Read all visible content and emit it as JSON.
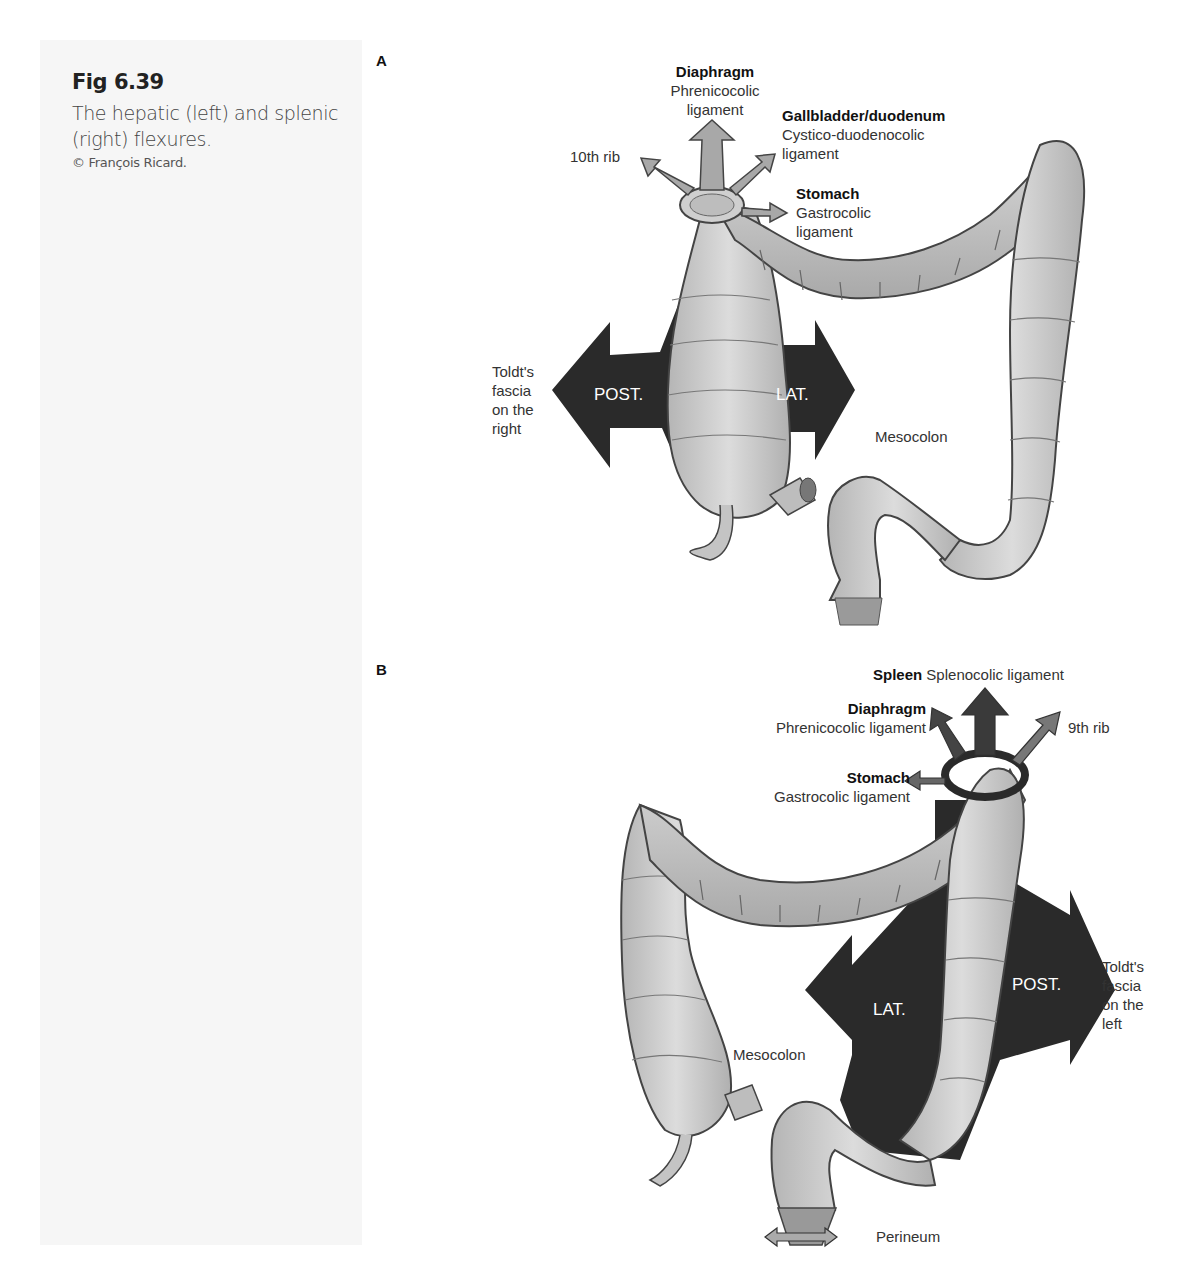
{
  "figure": {
    "number": "Fig 6.39",
    "caption": "The hepatic (left) and splenic (right) flexures.",
    "credit": "© François Ricard."
  },
  "panel_a": {
    "letter": "A",
    "labels": {
      "diaphragm_title": "Diaphragm",
      "diaphragm_sub": "Phrenicocolic ligament",
      "gallbladder_title": "Gallbladder/duodenum",
      "gallbladder_sub": "Cystico-duodenocolic ligament",
      "rib": "10th rib",
      "stomach_title": "Stomach",
      "stomach_sub": "Gastrocolic ligament",
      "toldt": "Toldt's fascia on the right",
      "post": "POST.",
      "lat": "LAT.",
      "mesocolon": "Mesocolon"
    }
  },
  "panel_b": {
    "letter": "B",
    "labels": {
      "spleen_title": "Spleen",
      "spleen_sub": "Splenocolic ligament",
      "diaphragm_title": "Diaphragm",
      "diaphragm_sub": "Phrenicocolic ligament",
      "rib": "9th rib",
      "stomach_title": "Stomach",
      "stomach_sub": "Gastrocolic ligament",
      "lat": "LAT.",
      "post": "POST.",
      "toldt": "Toldt's fascia on the left",
      "mesocolon": "Mesocolon",
      "perineum": "Perineum"
    }
  },
  "colors": {
    "dark_arrow": "#2a2a2a",
    "light_arrow": "#a8a8a8",
    "colon_fill": "#c9c9c9",
    "colon_stroke": "#444444",
    "side_panel": "#f6f6f6"
  }
}
